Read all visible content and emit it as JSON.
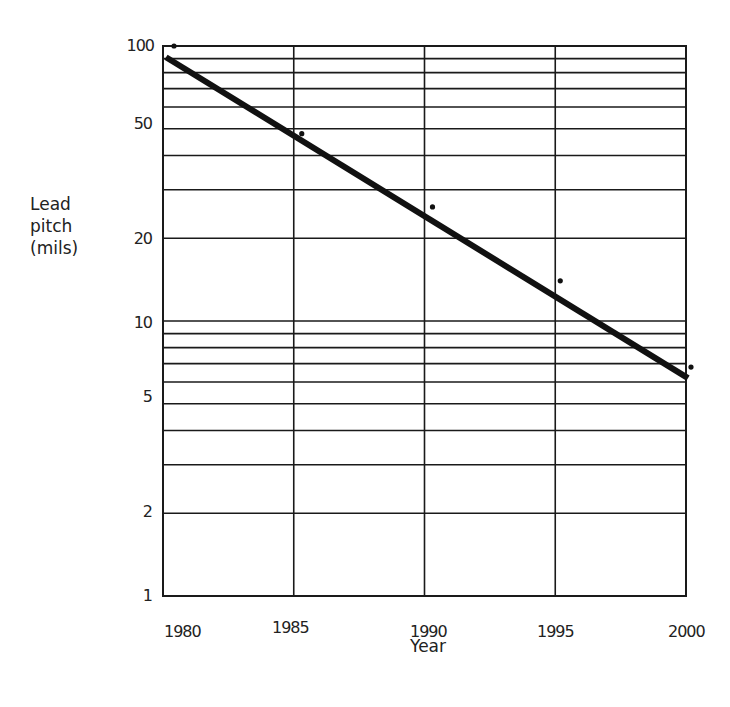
{
  "chart_data": {
    "type": "scatter",
    "title": "",
    "xlabel": "Year",
    "ylabel": "Lead pitch (mils)",
    "ylabel_lines": [
      "Lead",
      "pitch",
      "(mils)"
    ],
    "yscale": "log",
    "xlim": [
      1980,
      2000
    ],
    "ylim": [
      1,
      100
    ],
    "grid": true,
    "x_ticks": [
      "1980",
      "1985",
      "1990",
      "1995",
      "2000"
    ],
    "y_ticks": [
      "1",
      "2",
      "5",
      "10",
      "20",
      "50",
      "100"
    ],
    "y_gridlines": [
      1,
      2,
      3,
      4,
      5,
      6,
      7,
      8,
      9,
      10,
      20,
      30,
      40,
      50,
      60,
      70,
      80,
      90,
      100
    ],
    "series": [
      {
        "name": "Data points",
        "type": "scatter",
        "x": [
          1980,
          1985,
          1990,
          1995,
          2000
        ],
        "y": [
          100,
          48,
          26,
          14,
          6.8
        ]
      },
      {
        "name": "Trend line",
        "type": "line",
        "x": [
          1980,
          2000
        ],
        "y": [
          91,
          6.2
        ]
      }
    ]
  }
}
